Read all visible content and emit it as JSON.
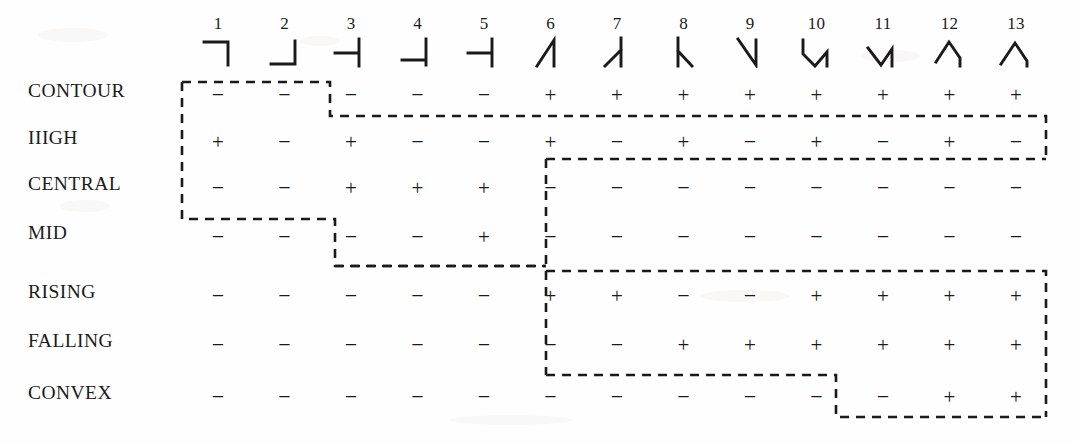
{
  "figure": {
    "kind": "feature-matrix",
    "row_label_header": "",
    "symbol_plus": "+",
    "symbol_minus": "−"
  },
  "columns": [
    {
      "number": "1",
      "glyph": "corner-left-down-icon"
    },
    {
      "number": "2",
      "glyph": "corner-left-up-icon"
    },
    {
      "number": "3",
      "glyph": "tee-left-icon"
    },
    {
      "number": "4",
      "glyph": "corner-left-vertical-icon"
    },
    {
      "number": "5",
      "glyph": "tee-left-short-icon"
    },
    {
      "number": "6",
      "glyph": "diagonal-peak-right-vertical-icon"
    },
    {
      "number": "7",
      "glyph": "vertical-with-lower-left-branch-icon"
    },
    {
      "number": "8",
      "glyph": "vertical-with-lower-right-branch-icon"
    },
    {
      "number": "9",
      "glyph": "diagonal-valley-right-vertical-icon"
    },
    {
      "number": "10",
      "glyph": "vee-with-left-and-right-verticals-icon"
    },
    {
      "number": "11",
      "glyph": "vee-with-right-vertical-icon"
    },
    {
      "number": "12",
      "glyph": "peak-with-right-vertical-icon"
    },
    {
      "number": "13",
      "glyph": "wide-peak-with-right-vertical-icon"
    }
  ],
  "rows": [
    {
      "label": "CONTOUR",
      "values": [
        "−",
        "−",
        "−",
        "−",
        "−",
        "+",
        "+",
        "+",
        "+",
        "+",
        "+",
        "+",
        "+"
      ]
    },
    {
      "label": "IIIGH",
      "values": [
        "+",
        "−",
        "+",
        "−",
        "−",
        "+",
        "−",
        "+",
        "−",
        "+",
        "−",
        "+",
        "−"
      ]
    },
    {
      "label": "CENTRAL",
      "values": [
        "−",
        "−",
        "+",
        "+",
        "+",
        "−",
        "−",
        "−",
        "−",
        "−",
        "−",
        "−",
        "−"
      ]
    },
    {
      "label": "MID",
      "values": [
        "−",
        "−",
        "−",
        "−",
        "+",
        "−",
        "−",
        "−",
        "−",
        "−",
        "−",
        "−",
        "−"
      ]
    },
    {
      "label": "RISING",
      "values": [
        "−",
        "−",
        "−",
        "−",
        "−",
        "+",
        "+",
        "−",
        "−",
        "+",
        "+",
        "+",
        "+"
      ]
    },
    {
      "label": "FALLING",
      "values": [
        "−",
        "−",
        "−",
        "−",
        "−",
        "−",
        "−",
        "+",
        "+",
        "+",
        "+",
        "+",
        "+"
      ]
    },
    {
      "label": "CONVEX",
      "values": [
        "−",
        "−",
        "−",
        "−",
        "−",
        "−",
        "−",
        "−",
        "−",
        "−",
        "−",
        "+",
        "+"
      ]
    }
  ],
  "chart_data": {
    "type": "table",
    "title": "",
    "xlabel": "",
    "ylabel": "",
    "categories": [
      "1",
      "2",
      "3",
      "4",
      "5",
      "6",
      "7",
      "8",
      "9",
      "10",
      "11",
      "12",
      "13"
    ],
    "row_names": [
      "CONTOUR",
      "IIIGH",
      "CENTRAL",
      "MID",
      "RISING",
      "FALLING",
      "CONVEX"
    ],
    "cells": [
      [
        "−",
        "−",
        "−",
        "−",
        "−",
        "+",
        "+",
        "+",
        "+",
        "+",
        "+",
        "+",
        "+"
      ],
      [
        "+",
        "−",
        "+",
        "−",
        "−",
        "+",
        "−",
        "+",
        "−",
        "+",
        "−",
        "+",
        "−"
      ],
      [
        "−",
        "−",
        "+",
        "+",
        "+",
        "−",
        "−",
        "−",
        "−",
        "−",
        "−",
        "−",
        "−"
      ],
      [
        "−",
        "−",
        "−",
        "−",
        "+",
        "−",
        "−",
        "−",
        "−",
        "−",
        "−",
        "−",
        "−"
      ],
      [
        "−",
        "−",
        "−",
        "−",
        "−",
        "+",
        "+",
        "−",
        "−",
        "+",
        "+",
        "+",
        "+"
      ],
      [
        "−",
        "−",
        "−",
        "−",
        "−",
        "−",
        "−",
        "+",
        "+",
        "+",
        "+",
        "+",
        "+"
      ],
      [
        "−",
        "−",
        "−",
        "−",
        "−",
        "−",
        "−",
        "−",
        "−",
        "−",
        "−",
        "+",
        "+"
      ]
    ],
    "legend": [],
    "grid": false
  }
}
